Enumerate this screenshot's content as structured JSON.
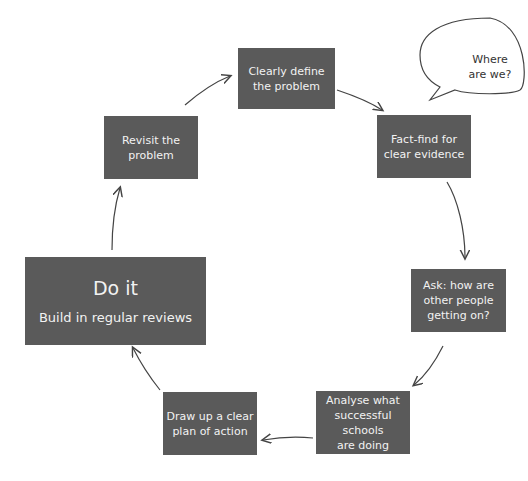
{
  "diagram": {
    "type": "cycle",
    "steps": [
      {
        "id": "define",
        "lines": [
          "Clearly define",
          "the problem"
        ]
      },
      {
        "id": "factfind",
        "lines": [
          "Fact-find for",
          "clear evidence"
        ]
      },
      {
        "id": "ask",
        "lines": [
          "Ask: how are",
          "other people",
          "getting on?"
        ]
      },
      {
        "id": "analyse",
        "lines": [
          "Analyse what",
          "successful schools",
          "are doing"
        ]
      },
      {
        "id": "plan",
        "lines": [
          "Draw up a clear",
          "plan of action"
        ]
      },
      {
        "id": "doit",
        "title": "Do it",
        "subtitle": "Build in regular reviews"
      },
      {
        "id": "revisit",
        "lines": [
          "Revisit the",
          "problem"
        ]
      }
    ],
    "speech_bubble": {
      "lines": [
        "Where",
        "are we?"
      ]
    },
    "colors": {
      "box": "#5a5a5a",
      "text": "#f2f2f2",
      "arrow": "#444444"
    }
  }
}
